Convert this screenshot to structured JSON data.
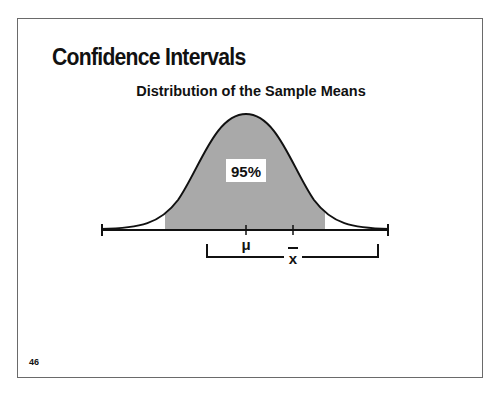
{
  "slide": {
    "title": "Confidence Intervals",
    "subtitle": "Distribution of the Sample Means",
    "page_number": "46"
  },
  "diagram": {
    "area_label": "95%",
    "mu_label": "μ",
    "xbar_label": "x",
    "colors": {
      "shaded_area": "#a9a9a9",
      "curve": "#111111",
      "label_box": "#ffffff"
    }
  }
}
